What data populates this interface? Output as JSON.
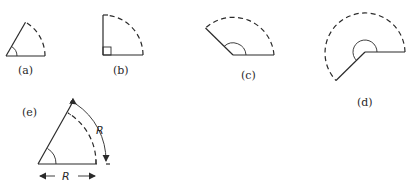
{
  "figure": {
    "panels": [
      {
        "id": "a",
        "label": "(a)",
        "angle_deg": 60,
        "marker": "arc"
      },
      {
        "id": "b",
        "label": "(b)",
        "angle_deg": 90,
        "marker": "right-angle-square"
      },
      {
        "id": "c",
        "label": "(c)",
        "angle_deg": 150,
        "marker": "arc"
      },
      {
        "id": "d",
        "label": "(d)",
        "angle_deg": 225,
        "marker": "arc"
      },
      {
        "id": "e",
        "label": "(e)",
        "angle_deg": 57.3,
        "marker": "arc",
        "arc_length_label": "R",
        "radius_label": "R"
      }
    ]
  }
}
